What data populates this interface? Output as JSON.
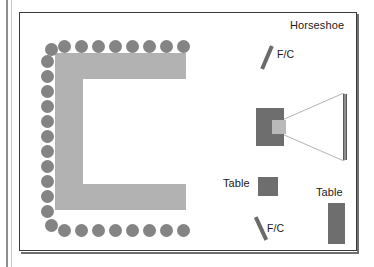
{
  "diagram": {
    "room": {
      "border_color": "#3a3a3a",
      "background": "#ffffff"
    },
    "labels": {
      "horseshoe": "Horseshoe",
      "table_center": "Table",
      "table_right": "Table",
      "flipchart_top": "F/C",
      "flipchart_bottom": "F/C"
    },
    "colors": {
      "horseshoe_table": "#b2b2b2",
      "chair": "#848484",
      "furniture": "#6e6e6e",
      "screen": "#8d8d8d",
      "projector_lens": "#b9b9b9",
      "light_cone": "#b0b0b0",
      "text": "#1a1a1a"
    },
    "elements": {
      "horseshoe_table_shape": "U-shape open to the right",
      "chair_counts": {
        "top_row": 8,
        "bottom_row": 8,
        "left_column": 11,
        "corners": 2,
        "total": 29
      },
      "projector": "projector-with-lens",
      "screen": "projection-screen",
      "light_cone": "projection-beam"
    },
    "chairs": {
      "top": [
        {
          "x": 58,
          "y": 40
        },
        {
          "x": 75,
          "y": 40
        },
        {
          "x": 92,
          "y": 40
        },
        {
          "x": 109,
          "y": 40
        },
        {
          "x": 126,
          "y": 40
        },
        {
          "x": 143,
          "y": 40
        },
        {
          "x": 160,
          "y": 40
        },
        {
          "x": 177,
          "y": 40
        }
      ],
      "bottom": [
        {
          "x": 58,
          "y": 224
        },
        {
          "x": 75,
          "y": 224
        },
        {
          "x": 92,
          "y": 224
        },
        {
          "x": 109,
          "y": 224
        },
        {
          "x": 126,
          "y": 224
        },
        {
          "x": 143,
          "y": 224
        },
        {
          "x": 160,
          "y": 224
        },
        {
          "x": 177,
          "y": 224
        }
      ],
      "left": [
        {
          "x": 41,
          "y": 55
        },
        {
          "x": 41,
          "y": 70
        },
        {
          "x": 41,
          "y": 85
        },
        {
          "x": 41,
          "y": 100
        },
        {
          "x": 41,
          "y": 115
        },
        {
          "x": 41,
          "y": 130
        },
        {
          "x": 41,
          "y": 145
        },
        {
          "x": 41,
          "y": 160
        },
        {
          "x": 41,
          "y": 175
        },
        {
          "x": 41,
          "y": 190
        },
        {
          "x": 41,
          "y": 205
        }
      ],
      "corners": [
        {
          "x": 45,
          "y": 43
        },
        {
          "x": 45,
          "y": 219
        }
      ]
    }
  }
}
